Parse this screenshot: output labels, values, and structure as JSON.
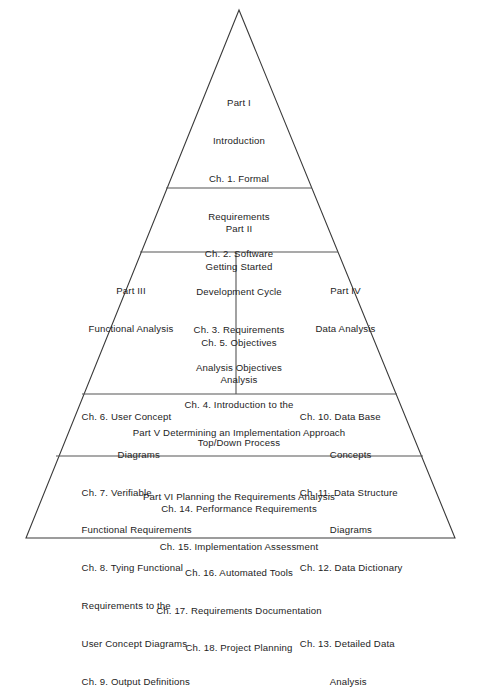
{
  "diagram": {
    "shape": "pyramid",
    "stroke_color": "#3a3a3a",
    "background_color": "#ffffff",
    "text_color": "#1d1d1d",
    "geometry": {
      "apex_x": 239,
      "apex_y": 10,
      "base_left_x": 26,
      "base_right_x": 455,
      "base_y": 538,
      "divider_y": [
        188,
        252,
        394,
        456
      ],
      "vertical_divider_x": 236,
      "vertical_divider_top_y": 252,
      "vertical_divider_bottom_y": 394
    }
  },
  "layers": [
    {
      "id": "part-1",
      "part_label": "Part I",
      "part_title": "Introduction",
      "entries": [
        "Ch. 1. Formal",
        "Requirements",
        "Ch. 2. Software",
        "Development Cycle",
        "Ch. 3. Requirements",
        "Analysis Objectives",
        "Ch. 4. Introduction to the",
        "Top/Down Process"
      ]
    },
    {
      "id": "part-2",
      "part_label": "Part II",
      "part_title": "Getting Started",
      "entries": [
        "",
        "Ch. 5. Objectives",
        "Analysis"
      ]
    },
    {
      "id": "part-3",
      "part_label": "Part III",
      "part_title": "Functional Analysis",
      "entries": [
        "",
        "Ch. 6. User Concept",
        "Diagrams",
        "Ch. 7. Verifiable",
        "Functional Requirements",
        "Ch. 8. Tying Functional",
        "Requirements to the",
        "User Concept Diagrams",
        "Ch. 9. Output Definitions"
      ]
    },
    {
      "id": "part-4",
      "part_label": "Part IV",
      "part_title": "Data Analysis",
      "entries": [
        "",
        "Ch. 10. Data Base",
        "Concepts",
        "Ch. 11. Data Structure",
        "Diagrams",
        "Ch. 12. Data Dictionary",
        "",
        "Ch. 13. Detailed Data",
        "Analysis"
      ]
    },
    {
      "id": "part-5",
      "part_label": "Part V Determining an Implementation Approach",
      "part_title": "",
      "entries": [
        "",
        "Ch. 14. Performance Requirements",
        "Ch. 15. Implementation Assessment"
      ]
    },
    {
      "id": "part-6",
      "part_label": "Part VI Planning the Requirements Analysis",
      "part_title": "",
      "entries": [
        "",
        "Ch. 16. Automated Tools",
        "Ch. 17. Requirements Documentation",
        "Ch. 18. Project Planning"
      ]
    }
  ]
}
